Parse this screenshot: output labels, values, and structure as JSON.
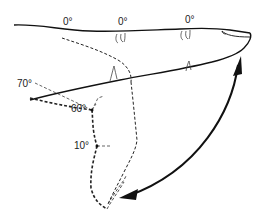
{
  "figure": {
    "labels": {
      "top_joint_1": "0°",
      "top_joint_2": "0°",
      "top_joint_3": "0°",
      "mcp_flexion": "70°",
      "pip_flexion": "60°",
      "dip_flexion": "10°"
    },
    "colors": {
      "stroke": "#111111",
      "dashed": "#222222",
      "background": "#ffffff"
    }
  }
}
